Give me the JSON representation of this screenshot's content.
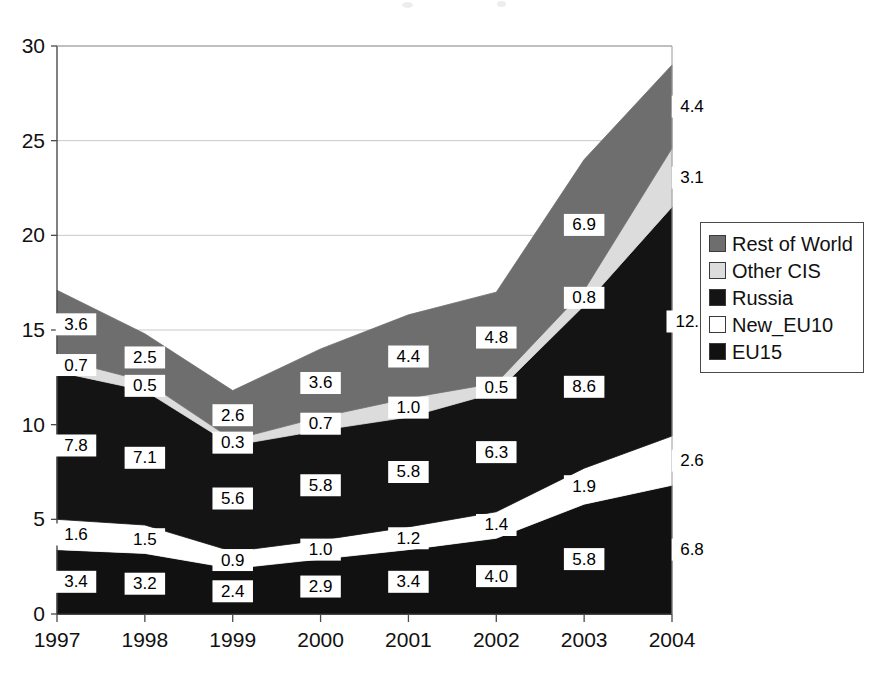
{
  "chart_data": {
    "type": "area",
    "stacked": true,
    "title": "",
    "subtitle": "",
    "xlabel": "",
    "ylabel": "",
    "categories": [
      "1997",
      "1998",
      "1999",
      "2000",
      "2001",
      "2002",
      "2003",
      "2004"
    ],
    "ylim": [
      0,
      30
    ],
    "yticks": [
      0,
      5,
      10,
      15,
      20,
      25,
      30
    ],
    "ytick_labels": [
      "0",
      "5",
      "10",
      "15",
      "20",
      "25",
      "30"
    ],
    "grid": "horizontal",
    "legend_position": "right",
    "series": [
      {
        "name": "EU15",
        "color": "#111111",
        "stack_order": 1,
        "values": [
          3.4,
          3.2,
          2.4,
          2.9,
          3.4,
          4.0,
          5.8,
          6.8
        ]
      },
      {
        "name": "New_EU10",
        "color": "#ffffff",
        "stack_order": 2,
        "values": [
          1.6,
          1.5,
          0.9,
          1.0,
          1.2,
          1.4,
          1.9,
          2.6
        ]
      },
      {
        "name": "Russia",
        "color": "#141414",
        "stack_order": 3,
        "values": [
          7.8,
          7.1,
          5.6,
          5.8,
          5.8,
          6.3,
          8.6,
          12.1
        ]
      },
      {
        "name": "Other CIS",
        "color": "#dcdcdc",
        "stack_order": 4,
        "values": [
          0.7,
          0.5,
          0.3,
          0.7,
          1.0,
          0.5,
          0.8,
          3.1
        ]
      },
      {
        "name": "Rest of World",
        "color": "#6e6e6e",
        "stack_order": 5,
        "values": [
          3.6,
          2.5,
          2.6,
          3.6,
          4.4,
          4.8,
          6.9,
          4.4
        ]
      }
    ],
    "totals": [
      17.1,
      14.8,
      11.8,
      14.0,
      15.8,
      17.0,
      24.0,
      29.0
    ]
  },
  "legend": {
    "items": [
      {
        "label": "Rest of World",
        "color": "#6e6e6e"
      },
      {
        "label": "Other CIS",
        "color": "#dcdcdc"
      },
      {
        "label": "Russia",
        "color": "#141414"
      },
      {
        "label": "New_EU10",
        "color": "#ffffff"
      },
      {
        "label": "EU15",
        "color": "#111111"
      }
    ]
  },
  "axes": {
    "y_labels": [
      "30",
      "25",
      "20",
      "15",
      "10",
      "5",
      "0"
    ],
    "x_labels": [
      "1997",
      "1998",
      "1999",
      "2000",
      "2001",
      "2002",
      "2003",
      "2004"
    ]
  }
}
